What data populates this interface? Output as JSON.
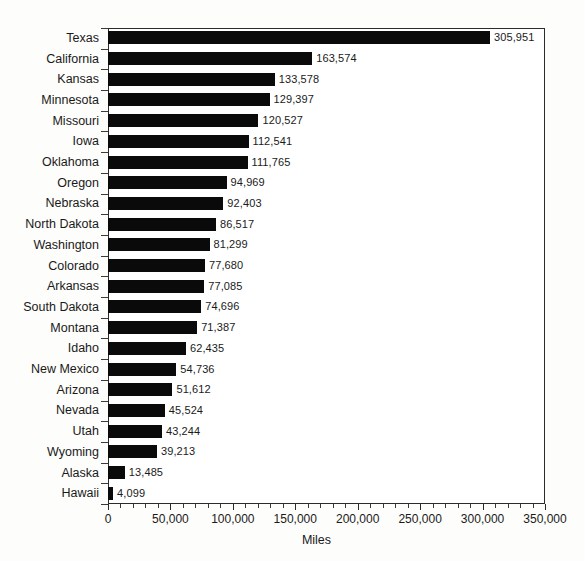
{
  "chart_data": {
    "type": "bar",
    "orientation": "horizontal",
    "title": "",
    "subtitle": "",
    "xlabel": "Miles",
    "ylabel": "",
    "xlim": [
      0,
      350000
    ],
    "ylim": null,
    "grid": false,
    "legend": null,
    "legend_position": "none",
    "bar_color": "#0a0a0a",
    "axis_color": "#2b2b2b",
    "background_color": "#ffffff",
    "x_major_ticks": [
      0,
      50000,
      100000,
      150000,
      200000,
      250000,
      300000,
      350000
    ],
    "x_tick_labels": [
      "0",
      "50,000",
      "100,000",
      "150,000",
      "200,000",
      "250,000",
      "300,000",
      "350,000"
    ],
    "x_minor_tick_interval": 10000,
    "categories": [
      "Texas",
      "California",
      "Kansas",
      "Minnesota",
      "Missouri",
      "Iowa",
      "Oklahoma",
      "Oregon",
      "Nebraska",
      "North Dakota",
      "Washington",
      "Colorado",
      "Arkansas",
      "South Dakota",
      "Montana",
      "Idaho",
      "New Mexico",
      "Arizona",
      "Nevada",
      "Utah",
      "Wyoming",
      "Alaska",
      "Hawaii"
    ],
    "values": [
      305951,
      163574,
      133578,
      129397,
      120527,
      112541,
      111765,
      94969,
      92403,
      86517,
      81299,
      77680,
      77085,
      74696,
      71387,
      62435,
      54736,
      51612,
      45524,
      43244,
      39213,
      13485,
      4099
    ],
    "data_labels": [
      "305,951",
      "163,574",
      "133,578",
      "129,397",
      "120,527",
      "112,541",
      "111,765",
      "94,969",
      "92,403",
      "86,517",
      "81,299",
      "77,680",
      "77,085",
      "74,696",
      "71,387",
      "62,435",
      "54,736",
      "51,612",
      "45,524",
      "43,244",
      "39,213",
      "13,485",
      "4,099"
    ]
  }
}
